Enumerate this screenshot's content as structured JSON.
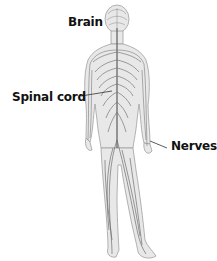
{
  "diagram": {
    "labels": {
      "brain": "Brain",
      "spinal_cord": "Spinal cord",
      "nerves": "Nerves"
    },
    "colors": {
      "body_fill": "#e6e6e6",
      "body_outline": "#9a9a9a",
      "nerve": "#707070",
      "leader_line": "#333333",
      "label_text": "#111111"
    }
  }
}
